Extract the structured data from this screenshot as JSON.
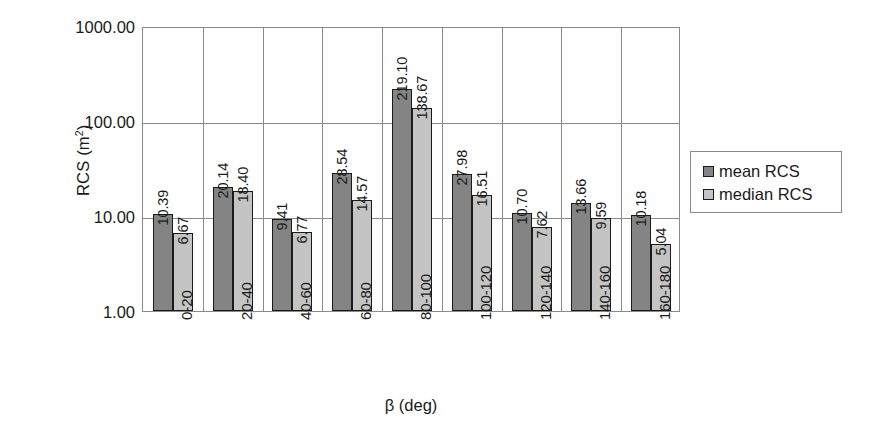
{
  "chart_data": {
    "type": "bar",
    "title": "",
    "xlabel": "β (deg)",
    "ylabel": "RCS (m²)",
    "ylabel_base": "RCS (m",
    "ylabel_sup": "2",
    "ylabel_close": ")",
    "yscale": "log",
    "ylim": [
      1.0,
      1000.0
    ],
    "ytick_labels": [
      "1000.00",
      "100.00",
      "10.00",
      "1.00"
    ],
    "ytick_values": [
      1000.0,
      100.0,
      10.0,
      1.0
    ],
    "grid": true,
    "legend_position": "right",
    "categories": [
      "0-20",
      "20-40",
      "40-60",
      "60-80",
      "80-100",
      "100-120",
      "120-140",
      "140-160",
      "160-180"
    ],
    "series": [
      {
        "name": "mean RCS",
        "color": "#848484",
        "values": [
          10.39,
          20.14,
          9.41,
          28.54,
          219.1,
          27.98,
          10.7,
          13.66,
          10.18
        ],
        "labels": [
          "10.39",
          "20.14",
          "9.41",
          "28.54",
          "219.10",
          "27.98",
          "10.70",
          "13.66",
          "10.18"
        ]
      },
      {
        "name": "median RCS",
        "color": "#c4c4c4",
        "values": [
          6.67,
          18.4,
          6.77,
          14.57,
          138.67,
          16.51,
          7.62,
          9.59,
          5.04
        ],
        "labels": [
          "6.67",
          "18.40",
          "6.77",
          "14.57",
          "138.67",
          "16.51",
          "7.62",
          "9.59",
          "5.04"
        ]
      }
    ]
  },
  "legend": {
    "entries": [
      {
        "label": "mean RCS",
        "color": "#848484"
      },
      {
        "label": "median RCS",
        "color": "#c4c4c4"
      }
    ]
  },
  "colors": {
    "mean": "#848484",
    "median": "#c4c4c4",
    "axis": "#8a8a8a",
    "text": "#1a1a1a",
    "background": "#ffffff"
  }
}
